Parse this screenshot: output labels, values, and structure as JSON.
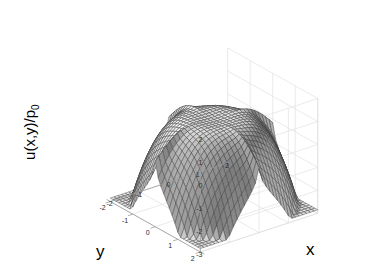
{
  "figure": {
    "background_color": "#ffffff",
    "plot_type": "3d-surface-mesh",
    "axes_color": "#9a9a9a",
    "grid_color": "#dcdcdc",
    "mesh_line_color": "#3a3a3a",
    "surface_light_color": "#e8e8e8",
    "surface_dark_color": "#585858"
  },
  "labels": {
    "x_axis": "x",
    "y_axis": "y",
    "z_axis_main": "u(x,y)/p",
    "z_axis_subscript": "0"
  },
  "chart_data": {
    "type": "surface",
    "title": "",
    "xlabel": "x",
    "ylabel": "y",
    "zlabel": "u(x,y)/p0",
    "xlim": [
      -2,
      2
    ],
    "ylim": [
      -2,
      2
    ],
    "zlim": [
      -3,
      2
    ],
    "xticks": [
      -2,
      -1,
      0,
      1,
      2
    ],
    "yticks": [
      2,
      1,
      0,
      -1,
      -2
    ],
    "zticks": [
      2,
      1,
      0,
      -1,
      -2,
      -3
    ],
    "xtick_labels": [
      "-2",
      "-1",
      "0",
      "1",
      "2"
    ],
    "ytick_labels": [
      "2",
      "1",
      "0",
      "-1",
      "-2"
    ],
    "ztick_labels": [
      "2",
      "1",
      "0",
      "-1",
      "-2",
      "-3"
    ],
    "grid": true,
    "legend": false,
    "colormap": "gray",
    "shading": "mesh-gray",
    "mesh_divisions_x": 32,
    "mesh_divisions_y": 32,
    "view_azimuth": -37.5,
    "view_elevation": 30,
    "z_center_peak": 1.0,
    "z_corner_min": -2.2,
    "surface_formula": "plateau minus quartic corner decay"
  }
}
